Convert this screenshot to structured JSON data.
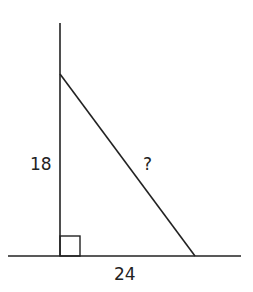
{
  "diagram": {
    "type": "right-triangle",
    "labels": {
      "vertical_leg": "18",
      "hypotenuse": "?",
      "horizontal_leg": "24"
    },
    "right_angle_marker": true,
    "stroke_color": "#222222"
  }
}
